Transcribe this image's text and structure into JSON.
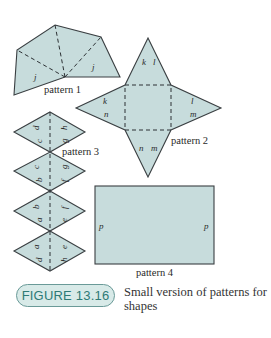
{
  "figure": {
    "badge": "FIGURE 13.16",
    "caption": "Small version of patterns for shapes"
  },
  "patterns": [
    {
      "name": "pattern 1",
      "labels": [
        "j",
        "j"
      ]
    },
    {
      "name": "pattern 2",
      "labels": [
        "k",
        "l",
        "k",
        "n",
        "l",
        "m",
        "n",
        "m"
      ]
    },
    {
      "name": "pattern 3",
      "labels": [
        "c",
        "d",
        "g",
        "h",
        "b",
        "c",
        "f",
        "g",
        "a",
        "b",
        "e",
        "f",
        "d",
        "a",
        "h",
        "e"
      ]
    },
    {
      "name": "pattern 4",
      "labels": [
        "p",
        "p"
      ]
    }
  ],
  "colors": {
    "fill": "#c7dcdc",
    "stroke": "#3a3f42",
    "badge_text": "#2e7a76",
    "badge_bg": "#d8eae8"
  }
}
